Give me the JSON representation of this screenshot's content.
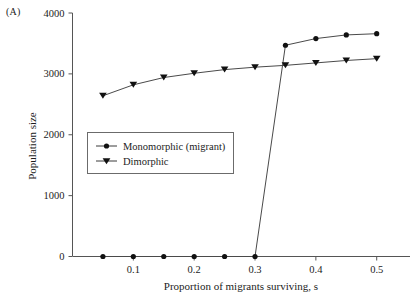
{
  "figure": {
    "panel_label": "(A)"
  },
  "chart_data": {
    "type": "line",
    "title": "",
    "xlabel": "Proportion of migrants surviving, s",
    "ylabel": "Population size",
    "xlim": [
      0.0,
      0.535
    ],
    "ylim": [
      0,
      4000
    ],
    "xticks": [
      0.1,
      0.2,
      0.3,
      0.4,
      0.5
    ],
    "xticklabels": [
      "0.1",
      "0.2",
      "0.3",
      "0.4",
      "0.5"
    ],
    "yticks": [
      0,
      1000,
      2000,
      3000,
      4000
    ],
    "yticklabels": [
      "0",
      "1000",
      "2000",
      "3000",
      "4000"
    ],
    "grid": false,
    "legend_position": "center-left",
    "series": [
      {
        "name": "Monomorphic (migrant)",
        "marker": "circle",
        "x": [
          0.05,
          0.1,
          0.15,
          0.2,
          0.25,
          0.3,
          0.35,
          0.4,
          0.45,
          0.5
        ],
        "values": [
          0,
          0,
          0,
          0,
          0,
          0,
          3470,
          3580,
          3640,
          3660
        ]
      },
      {
        "name": "Dimorphic",
        "marker": "triangle-down",
        "x": [
          0.05,
          0.1,
          0.15,
          0.2,
          0.25,
          0.3,
          0.35,
          0.4,
          0.45,
          0.5
        ],
        "values": [
          2640,
          2820,
          2940,
          3010,
          3070,
          3110,
          3140,
          3180,
          3220,
          3250
        ]
      }
    ]
  }
}
